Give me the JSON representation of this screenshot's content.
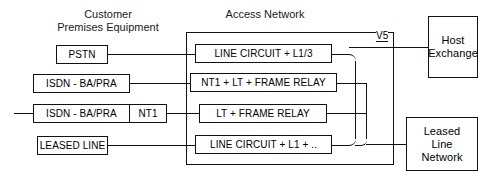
{
  "diagram": {
    "titles": {
      "cpe": "Customer\nPremises Equipment",
      "access_network": "Access Network"
    },
    "cpe_boxes": [
      {
        "id": "pstn",
        "label": "PSTN"
      },
      {
        "id": "isdn1",
        "label": "ISDN - BA/PRA"
      },
      {
        "id": "isdn2",
        "label": "ISDN - BA/PRA"
      },
      {
        "id": "nt1",
        "label": "NT1"
      },
      {
        "id": "leased",
        "label": "LEASED LINE"
      }
    ],
    "access_boxes": [
      {
        "id": "line-circuit-l13",
        "label": "LINE CIRCUIT + L1/3"
      },
      {
        "id": "nt1-lt-frame",
        "label": "NT1 + LT + FRAME RELAY"
      },
      {
        "id": "lt-frame",
        "label": "LT + FRAME RELAY"
      },
      {
        "id": "line-circuit-l1",
        "label": "LINE CIRCUIT + L1 + .."
      }
    ],
    "network_boxes": [
      {
        "id": "host-exchange",
        "label": "Host\nExchange"
      },
      {
        "id": "leased-line-network",
        "label": "Leased\nLine\nNetwork"
      }
    ],
    "interfaces": [
      {
        "id": "v5",
        "label": "V5"
      }
    ],
    "colors": {
      "line": "#111111",
      "text": "#000000",
      "background": "#ffffff"
    }
  }
}
